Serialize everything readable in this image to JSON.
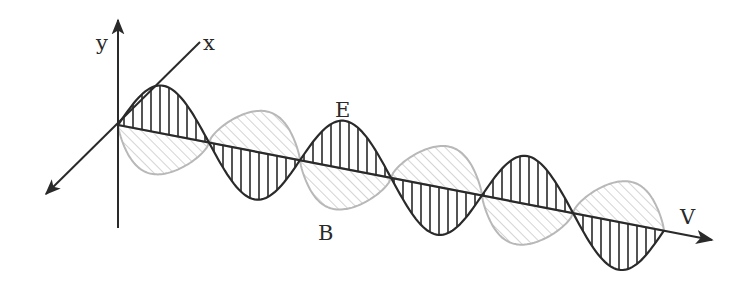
{
  "diagram": {
    "labels": {
      "y_axis": "y",
      "x_axis": "x",
      "electric_field": "E",
      "magnetic_field": "B",
      "propagation": "V"
    },
    "colors": {
      "axis": "#2a2a2a",
      "e_wave": "#2a2a2a",
      "b_wave": "#b8b8b8",
      "background": "#ffffff"
    },
    "geometry": {
      "origin": [
        118,
        125
      ],
      "v_axis_end": [
        713,
        240
      ],
      "half_period_px": 91,
      "e_amplitude_px": 48,
      "b_amplitude_px": 40,
      "half_cycles": 6
    }
  }
}
